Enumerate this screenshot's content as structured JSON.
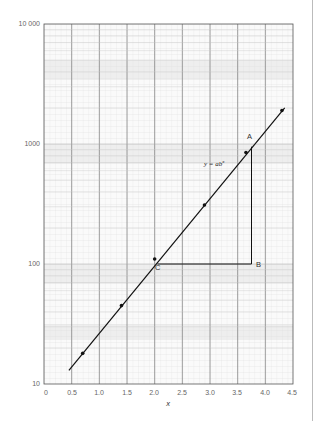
{
  "chart_data": {
    "type": "line",
    "title": "",
    "xlabel": "x",
    "ylabel": "",
    "yscale": "log",
    "xlim": [
      0,
      4.5
    ],
    "ylim": [
      10,
      10000
    ],
    "x_ticks": [
      "0",
      "0.5",
      "1.0",
      "1.5",
      "2.0",
      "2.5",
      "3.0",
      "3.5",
      "4.0",
      "4.5"
    ],
    "y_ticks": [
      "10",
      "100",
      "1000",
      "10 000"
    ],
    "grid": true,
    "series": [
      {
        "name": "y = ab^x",
        "line": [
          [
            0.45,
            13
          ],
          [
            4.35,
            2000
          ]
        ],
        "points": [
          [
            0.7,
            18
          ],
          [
            1.4,
            45
          ],
          [
            2.0,
            110
          ],
          [
            2.9,
            310
          ],
          [
            3.65,
            850
          ],
          [
            4.3,
            1900
          ]
        ]
      }
    ],
    "annotations": [
      {
        "label": "A",
        "x": 3.75,
        "y": 950
      },
      {
        "label": "B",
        "x": 3.75,
        "y": 100
      },
      {
        "label": "C",
        "x": 2.05,
        "y": 100
      },
      {
        "label": "y = ab^x",
        "x": 3.1,
        "y": 700
      }
    ],
    "triangle": {
      "A": [
        3.75,
        950
      ],
      "B": [
        3.75,
        100
      ],
      "C": [
        2.05,
        100
      ]
    }
  },
  "labels": {
    "x_axis": "x",
    "equation_prefix": "y = ab",
    "equation_sup": "x",
    "point_a": "A",
    "point_b": "B",
    "point_c": "C",
    "y_tick_10": "10",
    "y_tick_100": "100",
    "y_tick_1000": "1000",
    "y_tick_10000": "10 000",
    "x_tick_0": "0",
    "x_tick_05": "0.5",
    "x_tick_10": "1.0",
    "x_tick_15": "1.5",
    "x_tick_20": "2.0",
    "x_tick_25": "2.5",
    "x_tick_30": "3.0",
    "x_tick_35": "3.5",
    "x_tick_40": "4.0",
    "x_tick_45": "4.5"
  }
}
